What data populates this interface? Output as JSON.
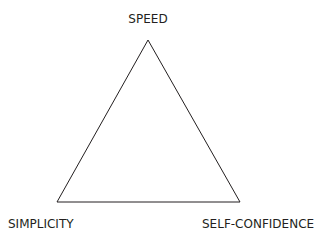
{
  "diagram": {
    "type": "triangle",
    "vertices": {
      "top": {
        "label": "SPEED",
        "x": 148,
        "y": 40
      },
      "bottom_left": {
        "label": "SIMPLICITY",
        "x": 57,
        "y": 202
      },
      "bottom_right": {
        "label": "SELF-CONFIDENCE",
        "x": 240,
        "y": 202
      }
    },
    "stroke_color": "#231f20",
    "background_color": "#ffffff"
  }
}
